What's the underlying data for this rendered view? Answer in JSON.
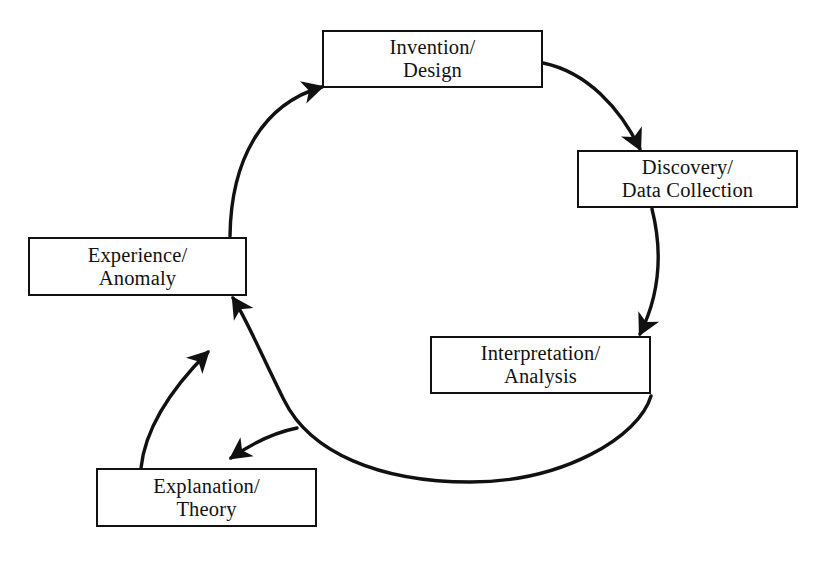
{
  "diagram": {
    "type": "cycle-diagram",
    "background_color": "#ffffff",
    "stroke_color": "#111111",
    "nodes": [
      {
        "id": "invention-design",
        "line1": "Invention/",
        "line2": "Design",
        "x": 322,
        "y": 30,
        "w": 221,
        "h": 58
      },
      {
        "id": "discovery-data-collection",
        "line1": "Discovery/",
        "line2": "Data Collection",
        "x": 577,
        "y": 150,
        "w": 221,
        "h": 58
      },
      {
        "id": "interpretation-analysis",
        "line1": "Interpretation/",
        "line2": "Analysis",
        "x": 430,
        "y": 336,
        "w": 221,
        "h": 58
      },
      {
        "id": "explanation-theory",
        "line1": "Explanation/",
        "line2": "Theory",
        "x": 96,
        "y": 468,
        "w": 221,
        "h": 59
      },
      {
        "id": "experience-anomaly",
        "line1": "Experience/",
        "line2": "Anomaly",
        "x": 28,
        "y": 237,
        "w": 219,
        "h": 59
      }
    ],
    "edges": [
      {
        "id": "invention-to-discovery",
        "from": "invention-design",
        "to": "discovery-data-collection",
        "arrowhead": true
      },
      {
        "id": "discovery-to-interpretation",
        "from": "discovery-data-collection",
        "to": "interpretation-analysis",
        "arrowhead": true
      },
      {
        "id": "interpretation-to-explanation",
        "from": "interpretation-analysis",
        "to": "explanation-theory",
        "arrowhead": true
      },
      {
        "id": "interpretation-to-experience",
        "from": "interpretation-analysis",
        "to": "experience-anomaly",
        "arrowhead": true
      },
      {
        "id": "explanation-to-experience",
        "from": "explanation-theory",
        "to": "experience-anomaly",
        "arrowhead": true
      },
      {
        "id": "experience-to-invention",
        "from": "experience-anomaly",
        "to": "invention-design",
        "arrowhead": true
      }
    ]
  }
}
